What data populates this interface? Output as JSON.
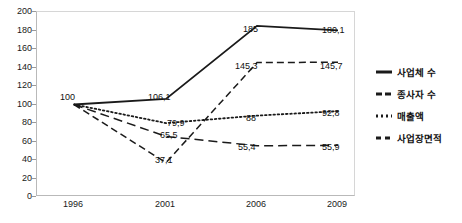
{
  "chart_data": {
    "type": "line",
    "title": "",
    "xlabel": "",
    "ylabel": "",
    "categories": [
      "1996",
      "2001",
      "2006",
      "2009"
    ],
    "ylim": [
      0,
      200
    ],
    "yticks": [
      0,
      20,
      40,
      60,
      80,
      100,
      120,
      140,
      160,
      180,
      200
    ],
    "grid": false,
    "legend_position": "right",
    "series": [
      {
        "name": "사업체 수",
        "style": "solid",
        "color": "#1a1a1a",
        "values": [
          100,
          106.1,
          185,
          180.1
        ],
        "labels": [
          "100",
          "106,1",
          "185",
          "180,1"
        ]
      },
      {
        "name": "종사자 수",
        "style": "dashed",
        "color": "#1a1a1a",
        "values": [
          100,
          37.1,
          145.3,
          145.7
        ],
        "labels": [
          "",
          "37,1",
          "145,3",
          "145,7"
        ]
      },
      {
        "name": "매출액",
        "style": "dotted",
        "color": "#1a1a1a",
        "values": [
          100,
          79.9,
          88,
          92.8
        ],
        "labels": [
          "",
          "79,9",
          "88",
          "92,8"
        ]
      },
      {
        "name": "사업장면적",
        "style": "longdash",
        "color": "#1a1a1a",
        "values": [
          100,
          65.5,
          55.4,
          55.9
        ],
        "labels": [
          "",
          "65,5",
          "55,4",
          "55,9"
        ]
      }
    ]
  },
  "axis": {
    "y_labels": [
      "200",
      "180",
      "160",
      "140",
      "120",
      "100",
      "80",
      "60",
      "40",
      "20",
      "0"
    ],
    "x_labels": [
      "1996",
      "2001",
      "2006",
      "2009"
    ]
  },
  "legend": {
    "items": [
      {
        "label": "사업체 수",
        "style": "solid"
      },
      {
        "label": "종사자 수",
        "style": "dashed"
      },
      {
        "label": "매출액",
        "style": "dotted"
      },
      {
        "label": "사업장면적",
        "style": "longdash"
      }
    ]
  },
  "point_labels": [
    {
      "text": "100",
      "x": 60,
      "y": 92
    },
    {
      "text": "106,1",
      "x": 148,
      "y": 92
    },
    {
      "text": "185",
      "x": 243,
      "y": 24
    },
    {
      "text": "180,1",
      "x": 322,
      "y": 25
    },
    {
      "text": "79,9",
      "x": 167,
      "y": 118
    },
    {
      "text": "65,5",
      "x": 160,
      "y": 130
    },
    {
      "text": "37,1",
      "x": 155,
      "y": 155
    },
    {
      "text": "145,3",
      "x": 235,
      "y": 61
    },
    {
      "text": "88",
      "x": 246,
      "y": 113
    },
    {
      "text": "55,4",
      "x": 238,
      "y": 142
    },
    {
      "text": "145,7",
      "x": 320,
      "y": 61
    },
    {
      "text": "92,8",
      "x": 322,
      "y": 108
    },
    {
      "text": "55,9",
      "x": 322,
      "y": 142
    }
  ]
}
